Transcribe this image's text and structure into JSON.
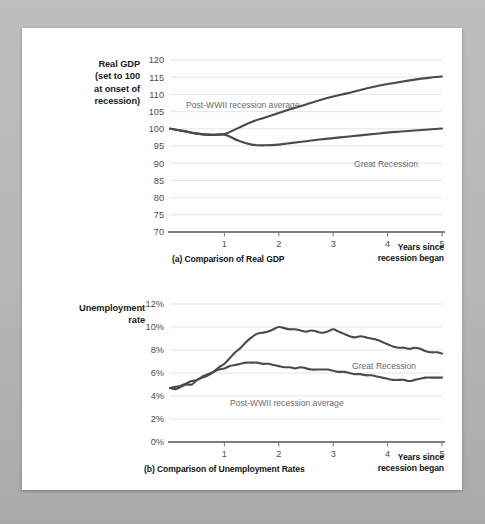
{
  "figure": {
    "background_color": "#b9b9b9",
    "panel_color": "#ffffff",
    "line_color": "#4a4a4a",
    "label_color": "#6a6a6a"
  },
  "chart_a": {
    "caption": "(a) Comparison of Real GDP",
    "axis_title": "Real GDP (set to 100 at onset of recession)",
    "axis_title_lines": [
      "Real GDP",
      "(set to 100",
      "at onset of",
      "recession)"
    ],
    "xlabel": "Years since recession began",
    "xlabel_lines": [
      "Years since",
      "recession began"
    ],
    "series_label_post_wwii": "Post-WWII recession average",
    "series_label_great": "Great Recession"
  },
  "chart_b": {
    "caption": "(b) Comparison of Unemployment Rates",
    "axis_title": "Unemployment rate",
    "axis_title_lines": [
      "Unemployment",
      "rate"
    ],
    "xlabel": "Years since recession began",
    "xlabel_lines": [
      "Years since",
      "recession began"
    ],
    "series_label_post_wwii": "Post-WWII recession average",
    "series_label_great": "Great Recession"
  },
  "chart_data": [
    {
      "type": "line",
      "id": "real-gdp",
      "title": "(a) Comparison of Real GDP",
      "xlabel": "Years since recession began",
      "ylabel": "Real GDP (set to 100 at onset of recession)",
      "xlim": [
        0,
        5
      ],
      "ylim": [
        70,
        120
      ],
      "xticks": [
        1,
        2,
        3,
        4,
        5
      ],
      "yticks": [
        70,
        75,
        80,
        85,
        90,
        95,
        100,
        105,
        110,
        115,
        120
      ],
      "grid": true,
      "legend": "inline-annotations",
      "x": [
        0,
        0.25,
        0.5,
        0.75,
        1.0,
        1.25,
        1.5,
        1.75,
        2.0,
        2.25,
        2.5,
        2.75,
        3.0,
        3.25,
        3.5,
        3.75,
        4.0,
        4.25,
        4.5,
        4.75,
        5.0
      ],
      "series": [
        {
          "name": "Post-WWII recession average",
          "values": [
            100.1,
            99.3,
            98.6,
            98.3,
            98.5,
            100.2,
            102.0,
            103.3,
            104.6,
            105.9,
            107.1,
            108.3,
            109.4,
            110.3,
            111.3,
            112.2,
            113.0,
            113.7,
            114.3,
            114.8,
            115.2
          ]
        },
        {
          "name": "Great Recession",
          "values": [
            100.0,
            99.4,
            98.6,
            98.2,
            98.3,
            96.6,
            95.4,
            95.2,
            95.4,
            95.9,
            96.4,
            96.9,
            97.3,
            97.7,
            98.1,
            98.5,
            98.9,
            99.2,
            99.5,
            99.8,
            100.1
          ]
        }
      ]
    },
    {
      "type": "line",
      "id": "unemployment-rate",
      "title": "(b) Comparison of Unemployment Rates",
      "xlabel": "Years since recession began",
      "ylabel": "Unemployment rate",
      "xlim": [
        0,
        5
      ],
      "ylim": [
        0,
        12
      ],
      "xticks": [
        1,
        2,
        3,
        4,
        5
      ],
      "yticks": [
        0,
        2,
        4,
        6,
        8,
        10,
        12
      ],
      "ytick_labels": [
        "0%",
        "2%",
        "4%",
        "6%",
        "8%",
        "10%",
        "12%"
      ],
      "grid": true,
      "legend": "inline-annotations",
      "x": [
        0,
        0.1,
        0.2,
        0.3,
        0.4,
        0.5,
        0.6,
        0.7,
        0.8,
        0.9,
        1.0,
        1.1,
        1.2,
        1.3,
        1.4,
        1.5,
        1.6,
        1.7,
        1.8,
        1.9,
        2.0,
        2.1,
        2.2,
        2.3,
        2.4,
        2.5,
        2.6,
        2.7,
        2.8,
        2.9,
        3.0,
        3.1,
        3.2,
        3.3,
        3.4,
        3.5,
        3.6,
        3.7,
        3.8,
        3.9,
        4.0,
        4.1,
        4.2,
        4.3,
        4.4,
        4.5,
        4.6,
        4.7,
        4.8,
        4.9,
        5.0
      ],
      "series": [
        {
          "name": "Great Recession",
          "values": [
            4.7,
            4.6,
            4.8,
            5.0,
            5.0,
            5.4,
            5.6,
            5.8,
            6.1,
            6.5,
            6.8,
            7.3,
            7.8,
            8.2,
            8.7,
            9.1,
            9.4,
            9.5,
            9.6,
            9.8,
            10.0,
            9.9,
            9.8,
            9.8,
            9.7,
            9.6,
            9.7,
            9.6,
            9.5,
            9.6,
            9.8,
            9.6,
            9.4,
            9.2,
            9.1,
            9.2,
            9.1,
            9.0,
            8.9,
            8.7,
            8.5,
            8.3,
            8.2,
            8.2,
            8.1,
            8.2,
            8.1,
            7.9,
            7.8,
            7.8,
            7.7
          ]
        },
        {
          "name": "Post-WWII recession average",
          "values": [
            4.7,
            4.8,
            4.9,
            5.1,
            5.3,
            5.4,
            5.7,
            5.9,
            6.1,
            6.3,
            6.4,
            6.6,
            6.7,
            6.8,
            6.9,
            6.9,
            6.9,
            6.8,
            6.8,
            6.7,
            6.6,
            6.5,
            6.5,
            6.4,
            6.5,
            6.4,
            6.3,
            6.3,
            6.3,
            6.3,
            6.2,
            6.1,
            6.1,
            6.0,
            5.9,
            5.9,
            5.8,
            5.8,
            5.7,
            5.6,
            5.5,
            5.4,
            5.4,
            5.4,
            5.3,
            5.4,
            5.5,
            5.6,
            5.6,
            5.6,
            5.6
          ]
        }
      ]
    }
  ]
}
